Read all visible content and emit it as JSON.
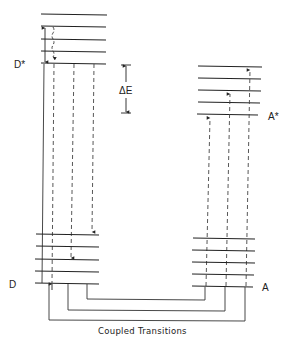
{
  "diagram": {
    "type": "energy-level-diagram",
    "labels": {
      "donor_excited": "D*",
      "donor_ground": "D",
      "acceptor_excited": "A*",
      "acceptor_ground": "A",
      "energy_gap": "ΔE",
      "caption": "Coupled Transitions"
    },
    "states": [
      {
        "id": "D*",
        "levels": 5
      },
      {
        "id": "D",
        "levels": 5
      },
      {
        "id": "A*",
        "levels": 5
      },
      {
        "id": "A",
        "levels": 5
      }
    ],
    "transitions": [
      {
        "from": "D*",
        "to": "D",
        "style": "dashed",
        "direction": "down",
        "count": 3
      },
      {
        "from": "A",
        "to": "A*",
        "style": "dashed",
        "direction": "up",
        "count": 3
      },
      {
        "within": "D*",
        "style": "solid",
        "kind": "vibrational-relaxation",
        "direction": "both"
      },
      {
        "within": "D*",
        "style": "wavy-dashed",
        "kind": "relaxation",
        "direction": "down"
      }
    ],
    "couplings": 3,
    "colors": {
      "line": "#222222",
      "background": "#ffffff"
    }
  }
}
